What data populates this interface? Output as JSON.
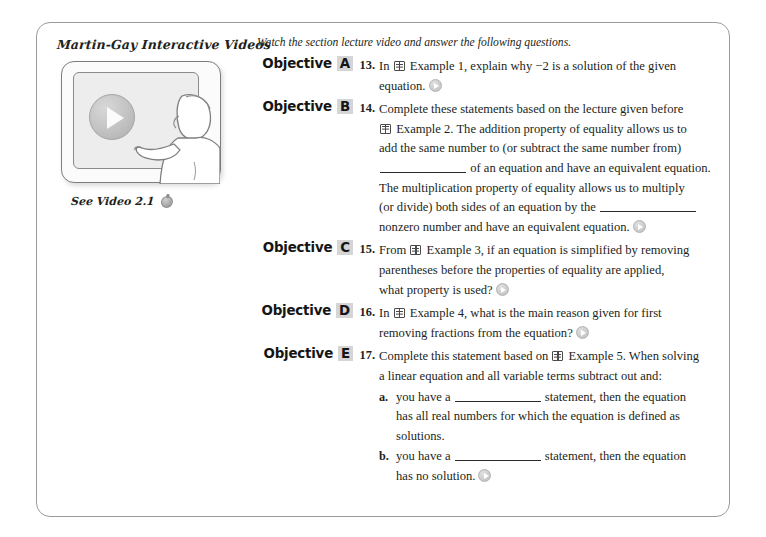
{
  "frame": {
    "border_color": "#9b9b9b"
  },
  "left": {
    "brand_title": "Martin-Gay Interactive Videos",
    "video_caption": "See Video 2.1",
    "caption_icon": "video-marker-icon",
    "art": {
      "play_button_icon": "play-button-icon",
      "whiteboard_icon": "whiteboard-screen",
      "presenter_icon": "presenter-silhouette"
    }
  },
  "right": {
    "instruction": "Watch the section lecture video and answer the following questions.",
    "objective_word": "Objective",
    "items": [
      {
        "letter": "A",
        "number": "13.",
        "lines": [
          {
            "segments": [
              {
                "type": "text",
                "text": "In "
              },
              {
                "type": "book-icon"
              },
              {
                "type": "text",
                "text": " Example 1, explain why −2 is a solution of the given"
              }
            ]
          },
          {
            "segments": [
              {
                "type": "text",
                "text": "equation."
              },
              {
                "type": "play-icon"
              }
            ]
          }
        ]
      },
      {
        "letter": "B",
        "number": "14.",
        "lines": [
          {
            "segments": [
              {
                "type": "text",
                "text": "Complete these statements based on the lecture given before"
              }
            ]
          },
          {
            "segments": [
              {
                "type": "book-icon"
              },
              {
                "type": "text",
                "text": " Example 2. The addition property of equality allows us to"
              }
            ]
          },
          {
            "segments": [
              {
                "type": "text",
                "text": "add the same number to (or subtract the same number from)"
              }
            ]
          },
          {
            "segments": [
              {
                "type": "blank"
              },
              {
                "type": "text",
                "text": " of an equation and have an equivalent equation."
              }
            ]
          },
          {
            "segments": [
              {
                "type": "text",
                "text": "The multiplication property of equality allows us to multiply"
              }
            ]
          },
          {
            "segments": [
              {
                "type": "text",
                "text": "(or divide) both sides of an equation by the "
              },
              {
                "type": "blank-wide"
              }
            ]
          },
          {
            "segments": [
              {
                "type": "text",
                "text": "nonzero number and have an equivalent equation."
              },
              {
                "type": "play-icon"
              }
            ]
          }
        ]
      },
      {
        "letter": "C",
        "number": "15.",
        "lines": [
          {
            "segments": [
              {
                "type": "text",
                "text": "From "
              },
              {
                "type": "book-icon"
              },
              {
                "type": "text",
                "text": " Example 3, if an equation is simplified by removing"
              }
            ]
          },
          {
            "segments": [
              {
                "type": "text",
                "text": "parentheses before the properties of equality are applied,"
              }
            ]
          },
          {
            "segments": [
              {
                "type": "text",
                "text": "what property is used?"
              },
              {
                "type": "play-icon"
              }
            ]
          }
        ]
      },
      {
        "letter": "D",
        "number": "16.",
        "lines": [
          {
            "segments": [
              {
                "type": "text",
                "text": "In "
              },
              {
                "type": "book-icon"
              },
              {
                "type": "text",
                "text": " Example 4, what is the main reason given for first"
              }
            ]
          },
          {
            "segments": [
              {
                "type": "text",
                "text": "removing fractions from the equation?"
              },
              {
                "type": "play-icon"
              }
            ]
          }
        ]
      },
      {
        "letter": "E",
        "number": "17.",
        "lines": [
          {
            "segments": [
              {
                "type": "text",
                "text": "Complete this statement based on "
              },
              {
                "type": "book-icon"
              },
              {
                "type": "text",
                "text": " Example 5. When solving"
              }
            ]
          },
          {
            "segments": [
              {
                "type": "text",
                "text": "a linear equation and all variable terms subtract out and:"
              }
            ]
          }
        ],
        "sub_items": [
          {
            "marker": "a.",
            "lines": [
              {
                "segments": [
                  {
                    "type": "text",
                    "text": "you have a "
                  },
                  {
                    "type": "blank"
                  },
                  {
                    "type": "text",
                    "text": " statement, then the equation"
                  }
                ]
              },
              {
                "segments": [
                  {
                    "type": "text",
                    "text": "has all real numbers for which the equation is defined as"
                  }
                ]
              },
              {
                "segments": [
                  {
                    "type": "text",
                    "text": "solutions."
                  }
                ]
              }
            ]
          },
          {
            "marker": "b.",
            "lines": [
              {
                "segments": [
                  {
                    "type": "text",
                    "text": "you have a "
                  },
                  {
                    "type": "blank"
                  },
                  {
                    "type": "text",
                    "text": " statement, then the equation"
                  }
                ]
              },
              {
                "segments": [
                  {
                    "type": "text",
                    "text": "has no solution."
                  },
                  {
                    "type": "play-icon"
                  }
                ]
              }
            ]
          }
        ]
      }
    ]
  }
}
